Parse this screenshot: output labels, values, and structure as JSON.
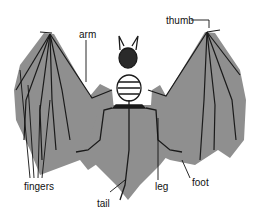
{
  "colors": {
    "membrane": "#8f8f8f",
    "bone": "#1a1a1a",
    "background": "#ffffff",
    "label": "#111111"
  },
  "labels": {
    "arm": "arm",
    "thumb": "thumb",
    "fingers": "fingers",
    "tail": "tail",
    "leg": "leg",
    "foot": "foot"
  }
}
